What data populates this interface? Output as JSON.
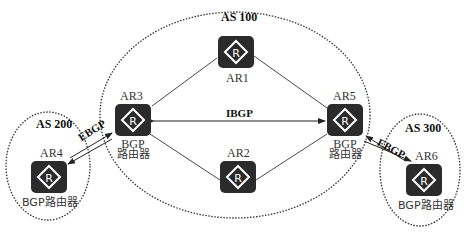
{
  "diagram": {
    "autonomous_systems": [
      {
        "id": "as100",
        "label": "AS 100"
      },
      {
        "id": "as200",
        "label": "AS 200"
      },
      {
        "id": "as300",
        "label": "AS 300"
      }
    ],
    "routers": {
      "ar1": {
        "name": "AR1",
        "icon": "router-icon"
      },
      "ar2": {
        "name": "AR2",
        "icon": "router-icon"
      },
      "ar3": {
        "name": "AR3",
        "role_line1": "BGP",
        "role_line2": "路由器",
        "icon": "router-icon"
      },
      "ar4": {
        "name": "AR4",
        "role": "BGP路由器",
        "icon": "router-icon"
      },
      "ar5": {
        "name": "AR5",
        "role_line1": "BGP",
        "role_line2": "路由器",
        "icon": "router-icon"
      },
      "ar6": {
        "name": "AR6",
        "role": "BGP路由器",
        "icon": "router-icon"
      }
    },
    "router_glyph": "R",
    "links": {
      "ibgp": "IBGP",
      "ebgp_left": "EBGP",
      "ebgp_right": "EBGP"
    },
    "colors": {
      "router_fill": "#2b2b2b",
      "line": "#333333",
      "background": "#ffffff"
    }
  }
}
